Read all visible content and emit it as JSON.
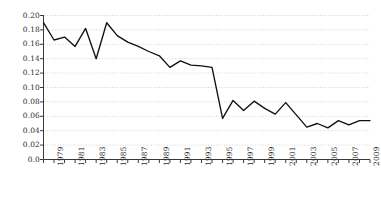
{
  "chart_data": {
    "type": "line",
    "title": "",
    "subtitle": "",
    "xlabel": "",
    "ylabel": "",
    "grid": true,
    "grid_style": "dotted-horizontal",
    "legend": "none",
    "line_color": "#111111",
    "background_color": "#ffffff",
    "axis_color": "#3a3a3a",
    "gridline_color": "#c8c8c8",
    "xlim": [
      1978,
      2009
    ],
    "ylim": [
      0.0,
      0.2
    ],
    "y_ticks": [
      0.0,
      0.02,
      0.04,
      0.06,
      0.08,
      0.1,
      0.12,
      0.14,
      0.16,
      0.18,
      0.2
    ],
    "y_tick_labels": [
      "0.0",
      "0.02",
      "0.04",
      "0.06",
      "0.08",
      "0.10",
      "0.12",
      "0.14",
      "0.16",
      "0.18",
      "0.20"
    ],
    "x_ticks": [
      1978,
      1979,
      1980,
      1981,
      1982,
      1983,
      1984,
      1985,
      1986,
      1987,
      1988,
      1989,
      1990,
      1991,
      1992,
      1993,
      1994,
      1995,
      1996,
      1997,
      1998,
      1999,
      2000,
      2001,
      2002,
      2003,
      2004,
      2005,
      2006,
      2007,
      2008,
      2009
    ],
    "x_tick_labels_shown": [
      "1979",
      "1981",
      "1983",
      "1985",
      "1987",
      "1989",
      "1991",
      "1993",
      "1995",
      "1997",
      "1999",
      "2001",
      "2003",
      "2005",
      "2007",
      "2009"
    ],
    "x_label_rotation_deg": -90,
    "x": [
      1978,
      1979,
      1980,
      1981,
      1982,
      1983,
      1984,
      1985,
      1986,
      1987,
      1988,
      1989,
      1990,
      1991,
      1992,
      1993,
      1994,
      1995,
      1996,
      1997,
      1998,
      1999,
      2000,
      2001,
      2002,
      2003,
      2004,
      2005,
      2006,
      2007,
      2008,
      2009
    ],
    "values": [
      0.19,
      0.166,
      0.17,
      0.157,
      0.182,
      0.14,
      0.19,
      0.172,
      0.163,
      0.157,
      0.15,
      0.144,
      0.128,
      0.137,
      0.131,
      0.13,
      0.128,
      0.057,
      0.082,
      0.068,
      0.081,
      0.071,
      0.063,
      0.079,
      0.062,
      0.045,
      0.05,
      0.044,
      0.054,
      0.048,
      0.054,
      0.054
    ],
    "series": [
      {
        "name": "series-1",
        "values": [
          0.19,
          0.166,
          0.17,
          0.157,
          0.182,
          0.14,
          0.19,
          0.172,
          0.163,
          0.157,
          0.15,
          0.144,
          0.128,
          0.137,
          0.131,
          0.13,
          0.128,
          0.057,
          0.082,
          0.068,
          0.081,
          0.071,
          0.063,
          0.079,
          0.062,
          0.045,
          0.05,
          0.044,
          0.054,
          0.048,
          0.054,
          0.054
        ]
      }
    ]
  }
}
